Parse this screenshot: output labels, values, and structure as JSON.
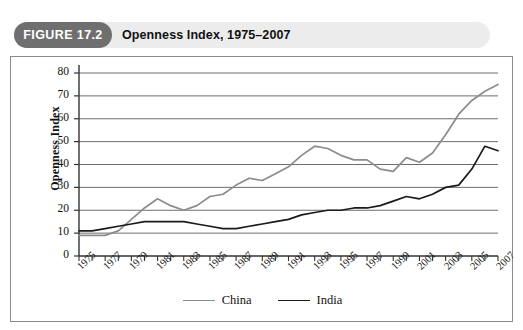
{
  "header": {
    "badge_label": "FIGURE 17.2",
    "title": "Openness Index, 1975–2007",
    "badge_color": "#6f6f6f",
    "band_color": "#ececec"
  },
  "legend": {
    "position": "bottom-center",
    "entries": [
      {
        "label": "China",
        "color": "#8c8c8c"
      },
      {
        "label": "India",
        "color": "#1a1a1a"
      }
    ]
  },
  "axes": {
    "ylabel": "Openness Index",
    "ytick_labels": [
      "80",
      "70",
      "60",
      "50",
      "40",
      "30",
      "20",
      "10",
      "0"
    ],
    "ylim": [
      0,
      80
    ],
    "ytick_step": 10,
    "xtick_labels": [
      "1975",
      "1977",
      "1979",
      "1981",
      "1983",
      "1985",
      "1987",
      "1989",
      "1991",
      "1993",
      "1995",
      "1997",
      "1999",
      "2001",
      "2003",
      "2005",
      "2007"
    ],
    "xlim": [
      1975,
      2007
    ],
    "grid": "horizontal"
  },
  "chart_data": {
    "type": "line",
    "title": "Openness Index, 1975–2007",
    "xlabel": "",
    "ylabel": "Openness Index",
    "ylim": [
      0,
      80
    ],
    "xlim": [
      1975,
      2007
    ],
    "grid": true,
    "legend_position": "bottom-center",
    "x": [
      1975,
      1976,
      1977,
      1978,
      1979,
      1980,
      1981,
      1982,
      1983,
      1984,
      1985,
      1986,
      1987,
      1988,
      1989,
      1990,
      1991,
      1992,
      1993,
      1994,
      1995,
      1996,
      1997,
      1998,
      1999,
      2000,
      2001,
      2002,
      2003,
      2004,
      2005,
      2006,
      2007
    ],
    "categories": [
      "1975",
      "1976",
      "1977",
      "1978",
      "1979",
      "1980",
      "1981",
      "1982",
      "1983",
      "1984",
      "1985",
      "1986",
      "1987",
      "1988",
      "1989",
      "1990",
      "1991",
      "1992",
      "1993",
      "1994",
      "1995",
      "1996",
      "1997",
      "1998",
      "1999",
      "2000",
      "2001",
      "2002",
      "2003",
      "2004",
      "2005",
      "2006",
      "2007"
    ],
    "series": [
      {
        "name": "China",
        "color": "#8c8c8c",
        "values": [
          9,
          9,
          9,
          11,
          16,
          21,
          25,
          22,
          20,
          22,
          26,
          27,
          31,
          34,
          33,
          36,
          39,
          44,
          48,
          47,
          44,
          42,
          42,
          38,
          37,
          43,
          41,
          45,
          53,
          62,
          68,
          72,
          75
        ]
      },
      {
        "name": "India",
        "color": "#1a1a1a",
        "values": [
          11,
          11,
          12,
          13,
          14,
          15,
          15,
          15,
          15,
          14,
          13,
          12,
          12,
          13,
          14,
          15,
          16,
          18,
          19,
          20,
          20,
          21,
          21,
          22,
          24,
          26,
          25,
          27,
          30,
          31,
          38,
          48,
          46
        ]
      }
    ]
  }
}
